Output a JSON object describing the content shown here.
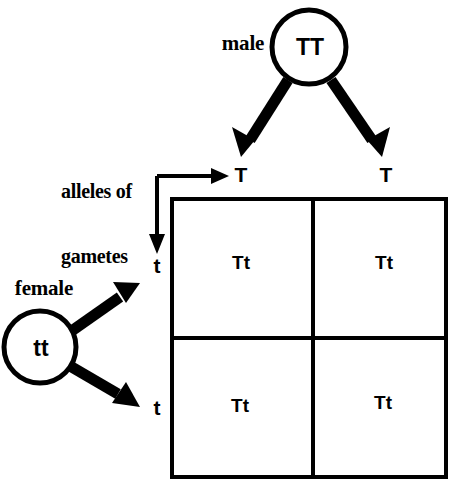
{
  "diagram": {
    "colors": {
      "ink": "#000000",
      "background": "#ffffff"
    },
    "parents": {
      "male": {
        "label": "male",
        "genotype": "TT"
      },
      "female": {
        "label": "female",
        "genotype": "tt"
      }
    },
    "gametes_caption": {
      "line1": "alleles of",
      "line2": "gametes"
    },
    "columns": {
      "headers": [
        "T",
        "T"
      ]
    },
    "rows": {
      "headers": [
        "t",
        "t"
      ]
    },
    "grid": {
      "cells": [
        [
          "Tt",
          "Tt"
        ],
        [
          "Tt",
          "Tt"
        ]
      ]
    }
  }
}
